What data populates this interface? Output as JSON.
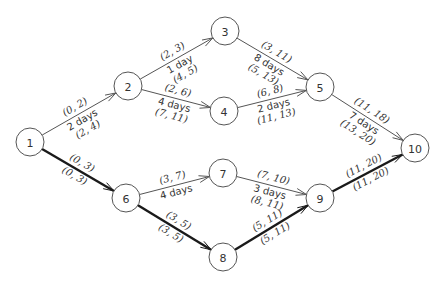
{
  "nodes": [
    {
      "id": "1",
      "x": 30,
      "y": 142
    },
    {
      "id": "2",
      "x": 128,
      "y": 86
    },
    {
      "id": "3",
      "x": 225,
      "y": 31
    },
    {
      "id": "4",
      "x": 224,
      "y": 111
    },
    {
      "id": "5",
      "x": 320,
      "y": 87
    },
    {
      "id": "6",
      "x": 126,
      "y": 198
    },
    {
      "id": "7",
      "x": 223,
      "y": 173
    },
    {
      "id": "8",
      "x": 223,
      "y": 257
    },
    {
      "id": "9",
      "x": 320,
      "y": 198
    },
    {
      "id": "10",
      "x": 415,
      "y": 148
    }
  ],
  "edges": [
    {
      "from": "1",
      "to": "2",
      "critical": false,
      "top": "(0, 2)",
      "duration": "2 days",
      "bottom": "(2, 4)"
    },
    {
      "from": "2",
      "to": "3",
      "critical": false,
      "top": "(2, 3)",
      "duration": "1 day",
      "bottom": "(4, 5)"
    },
    {
      "from": "2",
      "to": "4",
      "critical": false,
      "top": "(2, 6)",
      "duration": "4 days",
      "bottom": "(7, 11)"
    },
    {
      "from": "3",
      "to": "5",
      "critical": false,
      "top": "(3, 11)",
      "duration": "8 days",
      "bottom": "(5, 13)"
    },
    {
      "from": "4",
      "to": "5",
      "critical": false,
      "top": "(6, 8)",
      "duration": "2 days",
      "bottom": "(11, 13)"
    },
    {
      "from": "5",
      "to": "10",
      "critical": false,
      "top": "(11, 18)",
      "duration": "7 days",
      "bottom": "(13, 20)"
    },
    {
      "from": "1",
      "to": "6",
      "critical": true,
      "top": "(0, 3)",
      "duration": "",
      "bottom": "(0, 3)"
    },
    {
      "from": "6",
      "to": "7",
      "critical": false,
      "top": "(3, 7)",
      "duration": "4 days",
      "bottom": ""
    },
    {
      "from": "6",
      "to": "8",
      "critical": true,
      "top": "(3, 5)",
      "duration": "",
      "bottom": "(3, 5)"
    },
    {
      "from": "7",
      "to": "9",
      "critical": false,
      "top": "(7, 10)",
      "duration": "3 days",
      "bottom": "(8, 11)"
    },
    {
      "from": "8",
      "to": "9",
      "critical": true,
      "top": "(5, 11)",
      "duration": "",
      "bottom": "(5, 11)"
    },
    {
      "from": "9",
      "to": "10",
      "critical": true,
      "top": "(11, 20)",
      "duration": "",
      "bottom": "(11, 20)"
    }
  ],
  "style": {
    "critical_color": "#1a1a1a",
    "edge_color": "#555555",
    "node_radius": 14
  }
}
